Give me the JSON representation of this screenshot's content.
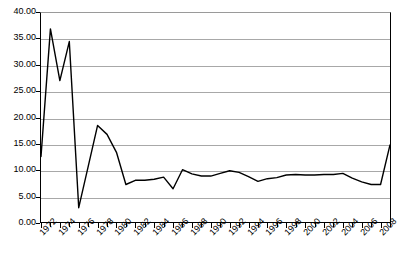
{
  "chart_data": {
    "type": "line",
    "title": "",
    "subtitle": "",
    "xlabel": "",
    "ylabel": "",
    "xlim": [
      1972,
      2009
    ],
    "ylim": [
      0,
      40
    ],
    "grid": true,
    "legend": false,
    "legend_position": "none",
    "line_color": "#000000",
    "background_color": "#ffffff",
    "gridline_color": "#a8a8a8",
    "axis_color": "#000000",
    "y_ticks": [
      "0.00",
      "5.00",
      "10.00",
      "15.00",
      "20.00",
      "25.00",
      "30.00",
      "35.00",
      "40.00"
    ],
    "y_tick_values": [
      0,
      5,
      10,
      15,
      20,
      25,
      30,
      35,
      40
    ],
    "x_tick_labels": [
      "1972",
      "1974",
      "1976",
      "1978",
      "1980",
      "1982",
      "1984",
      "1986",
      "1988",
      "1990",
      "1992",
      "1994",
      "1996",
      "1998",
      "2000",
      "2002",
      "2004",
      "2006",
      "2008"
    ],
    "x_tick_label_values": [
      1972,
      1974,
      1976,
      1978,
      1980,
      1982,
      1984,
      1986,
      1988,
      1990,
      1992,
      1994,
      1996,
      1998,
      2000,
      2002,
      2004,
      2006,
      2008
    ],
    "x": [
      1972,
      1973,
      1974,
      1975,
      1976,
      1977,
      1978,
      1979,
      1980,
      1981,
      1982,
      1983,
      1984,
      1985,
      1986,
      1987,
      1988,
      1989,
      1990,
      1991,
      1992,
      1993,
      1994,
      1995,
      1996,
      1997,
      1998,
      1999,
      2000,
      2001,
      2002,
      2003,
      2004,
      2005,
      2006,
      2007,
      2008,
      2009
    ],
    "values": [
      12.6,
      36.8,
      27.0,
      34.4,
      2.9,
      10.7,
      18.5,
      16.8,
      13.4,
      7.3,
      8.1,
      8.1,
      8.3,
      8.7,
      6.5,
      10.1,
      9.3,
      8.9,
      8.9,
      9.4,
      9.9,
      9.6,
      8.8,
      7.9,
      8.4,
      8.6,
      9.1,
      9.2,
      9.1,
      9.1,
      9.2,
      9.2,
      9.4,
      8.5,
      7.8,
      7.3,
      7.3,
      14.8
    ],
    "series": [
      {
        "name": "series-1",
        "values": [
          12.6,
          36.8,
          27.0,
          34.4,
          2.9,
          10.7,
          18.5,
          16.8,
          13.4,
          7.3,
          8.1,
          8.1,
          8.3,
          8.7,
          6.5,
          10.1,
          9.3,
          8.9,
          8.9,
          9.4,
          9.9,
          9.6,
          8.8,
          7.9,
          8.4,
          8.6,
          9.1,
          9.2,
          9.1,
          9.1,
          9.2,
          9.2,
          9.4,
          8.5,
          7.8,
          7.3,
          7.3,
          14.8
        ]
      }
    ]
  }
}
